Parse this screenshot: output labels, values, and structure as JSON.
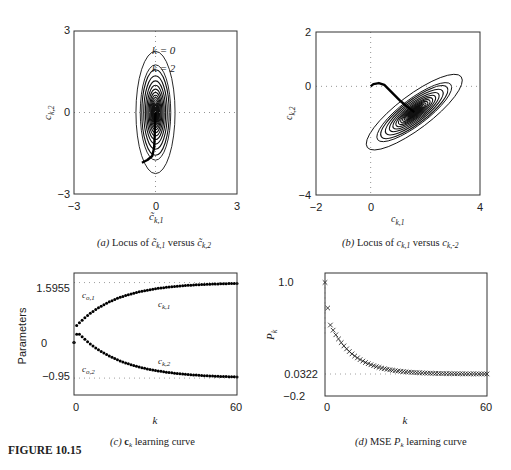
{
  "figure": {
    "label": "FIGURE 10.15"
  },
  "chart_data": [
    {
      "id": "a",
      "type": "contour",
      "caption": {
        "prefix": "(a)",
        "text": " Locus of ",
        "v1": "c̃",
        "s1": "k,1",
        "mid": " versus ",
        "v2": "c̃",
        "s2": "k,2"
      },
      "xlabel": {
        "var": "c̃",
        "sub": "k,1"
      },
      "ylabel": {
        "var": "c",
        "sub": "k,2"
      },
      "xlim": [
        -3,
        3
      ],
      "ylim": [
        -3,
        3
      ],
      "xticks": [
        "-3",
        "0",
        "3"
      ],
      "yticks": [
        "-3",
        "0",
        "3"
      ],
      "grid": "dotted lines at x=0 and y=0",
      "center": [
        0,
        0
      ],
      "annotations": [
        {
          "text": "k = 0",
          "x": 0.0,
          "y": 2.25
        },
        {
          "text": "k = 2",
          "x": 0.0,
          "y": 1.6
        }
      ],
      "contours": {
        "semi_x_outer": 0.72,
        "semi_y_outer": 2.25,
        "count": 22,
        "angle_deg": 0
      },
      "trajectory": [
        [
          -0.5,
          -1.85
        ],
        [
          -0.3,
          -1.75
        ],
        [
          -0.12,
          -1.6
        ],
        [
          -0.05,
          -1.3
        ],
        [
          -0.03,
          -0.9
        ],
        [
          -0.02,
          -0.5
        ],
        [
          -0.01,
          -0.2
        ],
        [
          0,
          0
        ]
      ]
    },
    {
      "id": "b",
      "type": "contour",
      "caption": {
        "prefix": "(b)",
        "text": " Locus of ",
        "v1": "c",
        "s1": "k,1",
        "mid": " versus ",
        "v2": "c",
        "s2": "k,-2"
      },
      "xlabel": {
        "var": "c",
        "sub": "k,1"
      },
      "ylabel": {
        "var": "c",
        "sub": "k,2"
      },
      "xlim": [
        -2,
        4
      ],
      "ylim": [
        -4,
        2
      ],
      "xticks": [
        "-2",
        "0",
        "4"
      ],
      "yticks": [
        "-4",
        "0",
        "2"
      ],
      "grid": "dotted lines at x=0 and y=0",
      "center": [
        1.5955,
        -0.95
      ],
      "contours": {
        "semi_major_outer": 2.15,
        "semi_minor_outer": 0.62,
        "count": 22,
        "angle_deg": -37
      },
      "trajectory": [
        [
          0,
          0
        ],
        [
          0.1,
          0.08
        ],
        [
          0.3,
          0.12
        ],
        [
          0.5,
          0.05
        ],
        [
          0.8,
          -0.25
        ],
        [
          1.1,
          -0.55
        ],
        [
          1.4,
          -0.8
        ],
        [
          1.5955,
          -0.95
        ]
      ]
    },
    {
      "id": "c",
      "type": "scatter",
      "caption": {
        "prefix": "(c)",
        "bold": "c",
        "sub": "k",
        "text": " learning curve"
      },
      "title": "",
      "xlabel": "k",
      "ylabel": "Parameters",
      "xlim": [
        0,
        60
      ],
      "ylim": [
        -1.4,
        1.85
      ],
      "xticks": [
        "0",
        "60"
      ],
      "yticks": [
        {
          "value": 1.5955,
          "label": "1.5955"
        },
        {
          "value": 0,
          "label": "0"
        },
        {
          "value": -0.95,
          "label": "-0.95"
        }
      ],
      "reference_lines": [
        {
          "value": 1.5955,
          "label": "c",
          "sub": "o,1"
        },
        {
          "value": -0.95,
          "label": "c",
          "sub": "o,2"
        }
      ],
      "series": [
        {
          "name": "c_k,1",
          "label": "c",
          "sub": "k,1",
          "start": 0.0,
          "jump": 0.45,
          "final": 1.5955,
          "tau": 15
        },
        {
          "name": "c_k,2",
          "label": "c",
          "sub": "k,2",
          "start": 0.0,
          "peak": 0.22,
          "final": -0.95,
          "tau": 16
        }
      ],
      "num_points": 61
    },
    {
      "id": "d",
      "type": "scatter",
      "caption": {
        "prefix": "(d)",
        "text": " MSE ",
        "var": "P",
        "sub": "k",
        "tail": " learning curve"
      },
      "xlabel": "k",
      "ylabel": {
        "var": "P",
        "sub": "k"
      },
      "xlim": [
        0,
        60
      ],
      "ylim": [
        -0.2,
        1.1
      ],
      "xticks": [
        "0",
        "60"
      ],
      "yticks": [
        {
          "value": 1.0,
          "label": "1.0"
        },
        {
          "value": 0.0322,
          "label": "0.0322"
        },
        {
          "value": -0.2,
          "label": "-0.2"
        }
      ],
      "reference_lines": [
        {
          "value": 0.0322
        }
      ],
      "marker": "x",
      "series": [
        {
          "name": "P_k",
          "first": 1.0,
          "second": 0.73,
          "third": 0.55,
          "final": 0.0322,
          "tau": 9
        }
      ],
      "num_points": 61
    }
  ]
}
